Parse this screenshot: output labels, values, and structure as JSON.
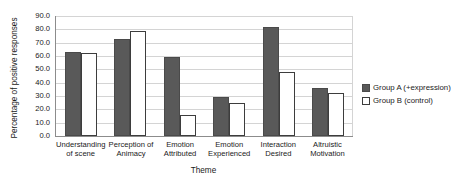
{
  "chart_data": {
    "type": "bar",
    "title": "",
    "xlabel": "Theme",
    "ylabel": "Percentage of positive responses",
    "ylim": [
      0,
      90
    ],
    "ytick_step": 10,
    "ytick_labels": [
      "90.0",
      "80.0",
      "70.0",
      "60.0",
      "50.0",
      "40.0",
      "30.0",
      "20.0",
      "10.0",
      "0.0"
    ],
    "ytick_values": [
      90,
      80,
      70,
      60,
      50,
      40,
      30,
      20,
      10,
      0
    ],
    "grid": true,
    "legend_position": "right",
    "categories": [
      "Understanding of scene",
      "Perception of Animacy",
      "Emotion Attributed",
      "Emotion Experienced",
      "Interaction Desired",
      "Altruistic Motivation"
    ],
    "category_lines": [
      [
        "Understanding",
        "of scene"
      ],
      [
        "Perception of",
        "Animacy"
      ],
      [
        "Emotion",
        "Attributed"
      ],
      [
        "Emotion",
        "Experienced"
      ],
      [
        "Interaction",
        "Desired"
      ],
      [
        "Altruistic",
        "Motivation"
      ]
    ],
    "series": [
      {
        "name": "Group A (+expression)",
        "color": "#595959",
        "values": [
          63.0,
          73.0,
          59.5,
          29.0,
          82.0,
          36.0
        ]
      },
      {
        "name": "Group B (control)",
        "color": "#ffffff",
        "values": [
          62.5,
          79.0,
          16.0,
          24.5,
          48.0,
          32.0
        ]
      }
    ]
  },
  "legend": {
    "items": [
      {
        "label": "Group A (+expression)"
      },
      {
        "label": "Group B (control)"
      }
    ]
  }
}
